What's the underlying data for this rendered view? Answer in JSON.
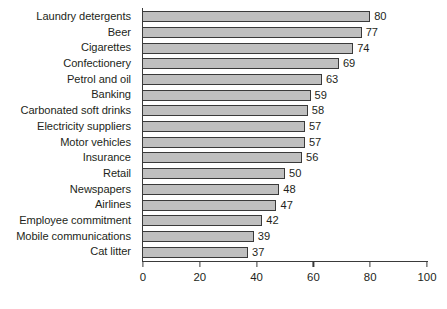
{
  "chart_data": {
    "type": "bar",
    "orientation": "horizontal",
    "title": "",
    "subtitle": "",
    "xlabel": "",
    "ylabel": "",
    "xlim": [
      0,
      100
    ],
    "xticks": [
      0,
      20,
      40,
      60,
      80,
      100
    ],
    "grid": false,
    "legend": null,
    "legend_position": "none",
    "categories": [
      "Laundry detergents",
      "Beer",
      "Cigarettes",
      "Confectionery",
      "Petrol and oil",
      "Banking",
      "Carbonated soft drinks",
      "Electricity suppliers",
      "Motor vehicles",
      "Insurance",
      "Retail",
      "Newspapers",
      "Airlines",
      "Employee commitment",
      "Mobile communications",
      "Cat litter"
    ],
    "values": [
      80,
      77,
      74,
      69,
      63,
      59,
      58,
      57,
      57,
      56,
      50,
      48,
      47,
      42,
      39,
      37
    ],
    "data_labels": [
      "80",
      "77",
      "74",
      "69",
      "63",
      "59",
      "58",
      "57",
      "57",
      "56",
      "50",
      "48",
      "47",
      "42",
      "39",
      "37"
    ],
    "bar_fill_color": "#bfbfbf",
    "bar_border_color": "#3a3a3a",
    "axis_color": "#3a3a3a",
    "text_color": "#231f20",
    "background_color": "#ffffff"
  }
}
